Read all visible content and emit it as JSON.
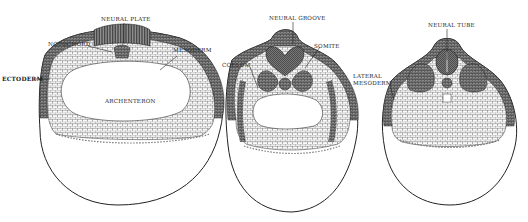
{
  "figure": {
    "panels": [
      {
        "id": "stage-1",
        "labels": {
          "neural_plate": "NEURAL PLATE",
          "notochord": "NOTOCHORD",
          "mesoderm": "MESODERM",
          "ectoderm": "ECTODERM",
          "archenteron": "ARCHENTERON"
        }
      },
      {
        "id": "stage-2",
        "labels": {
          "neural_groove": "NEURAL GROOVE",
          "somite": "SOMITE",
          "coelom": "COELOM"
        }
      },
      {
        "id": "stage-3",
        "labels": {
          "neural_tube": "NEURAL TUBE",
          "lateral_mesoderm_line1": "LATERAL",
          "lateral_mesoderm_line2": "MESODERM"
        }
      }
    ],
    "colors": {
      "ink": "#222222",
      "background": "#ffffff",
      "dark_tissue": "#555555",
      "cell_fill": "#f4f4f4"
    }
  }
}
